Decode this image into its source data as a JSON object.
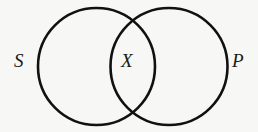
{
  "diagram": {
    "type": "venn",
    "sets": [
      {
        "id": "S",
        "label": "S",
        "cx": 96.5,
        "cy": 66.5,
        "r": 58.5
      },
      {
        "id": "P",
        "label": "P",
        "cx": 169,
        "cy": 66.5,
        "r": 58.5
      }
    ],
    "regions": [
      {
        "id": "intersection",
        "label": "X"
      }
    ],
    "labels": {
      "left_set": "S",
      "intersection": "X",
      "right_set": "P"
    },
    "colors": {
      "stroke": "#111111",
      "background": "#f7f7f5"
    }
  }
}
